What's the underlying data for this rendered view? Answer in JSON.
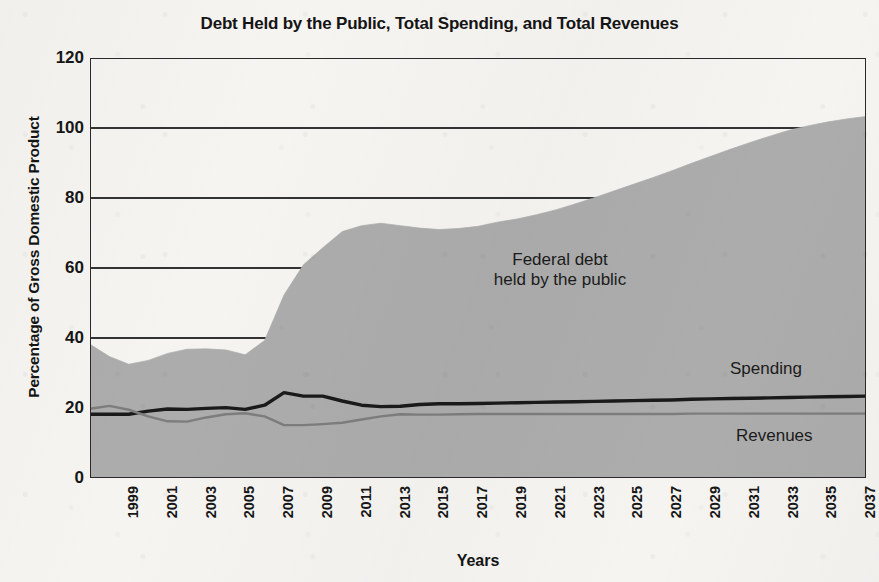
{
  "chart_data": {
    "type": "area",
    "title": "Debt Held by the Public, Total Spending, and Total Revenues",
    "xlabel": "Years",
    "ylabel": "Percentage of Gross Domestic Product",
    "ylim": [
      0,
      120
    ],
    "xlim": [
      1999,
      2039
    ],
    "ytick_values": [
      0,
      20,
      40,
      60,
      80,
      100,
      120
    ],
    "ytick_labels": [
      "0",
      "20",
      "40",
      "60",
      "80",
      "100",
      "120"
    ],
    "xtick_labels": [
      "1999",
      "2001",
      "2003",
      "2005",
      "2007",
      "2009",
      "2011",
      "2013",
      "2015",
      "2017",
      "2019",
      "2021",
      "2023",
      "2025",
      "2027",
      "2029",
      "2031",
      "2033",
      "2035",
      "2037",
      "2039"
    ],
    "grid": "horizontal",
    "legend_position": "inline-annotations",
    "annotations": [
      {
        "name": "federal-debt-label",
        "text_line1": "Federal debt",
        "text_line2": "held by the public",
        "x": 2020,
        "y": 57
      },
      {
        "name": "spending-label",
        "text": "Spending",
        "x": 2035,
        "y": 33
      },
      {
        "name": "revenues-label",
        "text": "Revenues",
        "x": 2035,
        "y": 14
      }
    ],
    "x": [
      1999,
      2000,
      2001,
      2002,
      2003,
      2004,
      2005,
      2006,
      2007,
      2008,
      2009,
      2010,
      2011,
      2012,
      2013,
      2014,
      2015,
      2016,
      2017,
      2018,
      2019,
      2020,
      2021,
      2022,
      2023,
      2024,
      2025,
      2026,
      2027,
      2028,
      2029,
      2030,
      2031,
      2032,
      2033,
      2034,
      2035,
      2036,
      2037,
      2038,
      2039
    ],
    "series": [
      {
        "name": "Federal debt held by the public",
        "type": "area",
        "color": "#acacac",
        "values": [
          38.2,
          34.7,
          32.5,
          33.6,
          35.6,
          36.8,
          36.9,
          36.6,
          35.2,
          39.3,
          52.3,
          60.9,
          65.8,
          70.4,
          72.1,
          72.8,
          72.1,
          71.4,
          71.0,
          71.3,
          71.9,
          73.1,
          74.0,
          75.2,
          76.6,
          78.3,
          80.1,
          82.0,
          83.9,
          85.8,
          87.8,
          89.9,
          91.9,
          93.9,
          95.8,
          97.6,
          99.3,
          100.6,
          101.7,
          102.6,
          103.3
        ]
      },
      {
        "name": "Spending",
        "type": "line",
        "color": "#1a1a1a",
        "values": [
          18.2,
          18.2,
          18.2,
          19.1,
          19.7,
          19.6,
          19.9,
          20.1,
          19.6,
          20.8,
          24.4,
          23.4,
          23.4,
          22.0,
          20.8,
          20.4,
          20.5,
          21.0,
          21.2,
          21.2,
          21.3,
          21.4,
          21.5,
          21.6,
          21.7,
          21.8,
          21.9,
          22.0,
          22.1,
          22.2,
          22.3,
          22.5,
          22.6,
          22.7,
          22.8,
          22.9,
          23.0,
          23.1,
          23.2,
          23.3,
          23.4
        ]
      },
      {
        "name": "Revenues",
        "type": "line",
        "color": "#7d7d7d",
        "values": [
          19.8,
          20.6,
          19.5,
          17.6,
          16.2,
          16.1,
          17.3,
          18.2,
          18.5,
          17.6,
          15.1,
          15.1,
          15.4,
          15.8,
          16.7,
          17.6,
          18.2,
          18.1,
          18.1,
          18.2,
          18.3,
          18.3,
          18.3,
          18.3,
          18.3,
          18.3,
          18.3,
          18.3,
          18.3,
          18.3,
          18.3,
          18.4,
          18.4,
          18.4,
          18.4,
          18.4,
          18.4,
          18.4,
          18.4,
          18.4,
          18.4
        ]
      }
    ]
  },
  "colors": {
    "paper": "#f5f4f1",
    "area_fill": "#acacac",
    "spending_line": "#1a1a1a",
    "revenues_line": "#7d7d7d",
    "axis": "#2a2a2a",
    "text": "#151515"
  }
}
